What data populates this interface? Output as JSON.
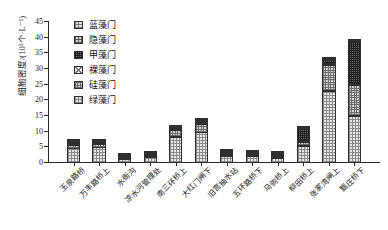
{
  "chart_data": {
    "type": "bar",
    "subtype": "stacked-bar",
    "title": "",
    "xlabel": "",
    "ylabel": "细胞密度/(10⁵个·L⁻¹)",
    "ylim": [
      0,
      45
    ],
    "ytick_labels": [
      "0",
      "5",
      "10",
      "15",
      "20",
      "25",
      "30",
      "35",
      "40",
      "45"
    ],
    "ytick_values": [
      0,
      5,
      10,
      15,
      20,
      25,
      30,
      35,
      40,
      45
    ],
    "grid": false,
    "legend_position": "top-left-inside",
    "categories": [
      "玉泉路桥",
      "万丰路桥上",
      "水衙沟",
      "凉水河管理处",
      "南三环桥上",
      "大红门闸下",
      "旧宫抽水站",
      "五环路桥下",
      "马驹桥上",
      "柳田桥上",
      "张家湾闸上",
      "甄庄桥下"
    ],
    "series": [
      {
        "name": "绿藻门",
        "pattern": "p-lvzao",
        "values": [
          4.6,
          5.0,
          1.3,
          1.7,
          8.3,
          9.7,
          2.2,
          2.1,
          1.6,
          5.4,
          23.0,
          15.0
        ]
      },
      {
        "name": "硅藻门",
        "pattern": "p-guizao",
        "values": [
          1.4,
          1.2,
          0.4,
          0.6,
          2.4,
          3.0,
          0.5,
          0.4,
          0.4,
          1.4,
          8.4,
          10.0
        ]
      },
      {
        "name": "裸藻门",
        "pattern": "p-luozao",
        "values": [
          0.3,
          0.2,
          0.1,
          0.1,
          0.4,
          0.4,
          0.1,
          0.1,
          0.1,
          0.4,
          0.5,
          0.6
        ]
      },
      {
        "name": "甲藻门",
        "pattern": "p-jiazao",
        "values": [
          0.2,
          0.2,
          0.1,
          0.1,
          0.3,
          0.3,
          0.1,
          0.1,
          0.1,
          4.0,
          1.5,
          13.8
        ]
      },
      {
        "name": "隐藻门",
        "pattern": "p-yinzao",
        "values": [
          0.2,
          0.1,
          0.0,
          0.1,
          0.2,
          0.2,
          0.1,
          0.1,
          0.1,
          0.3,
          0.3,
          0.4
        ]
      },
      {
        "name": "蓝藻门",
        "pattern": "p-lanzao",
        "values": [
          0.3,
          0.3,
          0.1,
          0.1,
          0.4,
          0.4,
          0.2,
          0.2,
          0.2,
          0.5,
          0.3,
          0.2
        ]
      }
    ],
    "totals": [
      7.0,
      7.0,
      2.0,
      2.6,
      12.0,
      14.0,
      3.2,
      3.0,
      2.5,
      12.0,
      34.0,
      40.0
    ]
  },
  "legend": {
    "items": [
      {
        "label": "蓝藻门",
        "pattern": "p-lanzao"
      },
      {
        "label": "隐藻门",
        "pattern": "p-yinzao"
      },
      {
        "label": "甲藻门",
        "pattern": "p-jiazao"
      },
      {
        "label": "裸藻门",
        "pattern": "p-luozao"
      },
      {
        "label": "硅藻门",
        "pattern": "p-guizao"
      },
      {
        "label": "绿藻门",
        "pattern": "p-lvzao"
      }
    ]
  },
  "colors": {
    "axis": "#2a2a2a",
    "text": "#1a1a1a",
    "background": "#ffffff"
  }
}
